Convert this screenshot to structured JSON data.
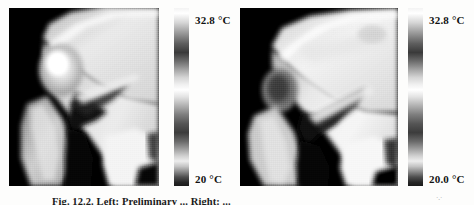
{
  "figure": {
    "caption": "Fig. 12.2. Left: Preliminary ... Right: ...",
    "panels": [
      {
        "id": "left",
        "name": "thermogram-left",
        "description": "Grayscale infrared thermogram of knee joint, lateral view",
        "colorbar": {
          "name": "temperature-colorbar",
          "max_label": "32.8 °C",
          "min_label": "20 °C",
          "max_value": 32.8,
          "min_value": 20,
          "unit": "°C",
          "scale": "grayscale"
        }
      },
      {
        "id": "right",
        "name": "thermogram-right",
        "description": "Grayscale infrared thermogram of knee joint, lateral view",
        "colorbar": {
          "name": "temperature-colorbar",
          "max_label": "32.8 °C",
          "min_label": "20.0 °C",
          "max_value": 32.8,
          "min_value": 20.0,
          "unit": "°C",
          "scale": "grayscale"
        }
      }
    ]
  }
}
